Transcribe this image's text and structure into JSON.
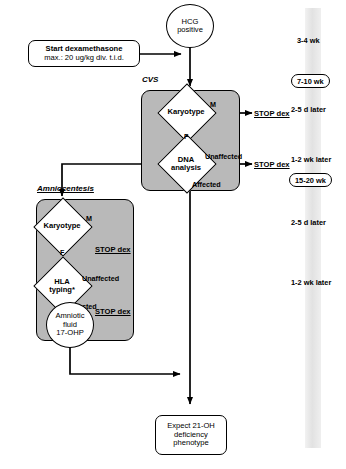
{
  "start": {
    "hcg_label": "HCG\npositive",
    "hcg_line1": "HCG",
    "hcg_line2": "positive",
    "treatment_line1": "Start dexamethasone",
    "treatment_line2": "max.: 20 ug/kg div. t.i.d."
  },
  "cvs": {
    "section_label": "CVS",
    "karyotype": "Karyotype",
    "dna_line1": "DNA",
    "dna_line2": "analysis",
    "branch_male": "M",
    "branch_female": "F",
    "branch_unaffected": "Unaffected",
    "branch_affected": "Affected",
    "stop_dex_male": "STOP dex",
    "stop_dex_unaffected": "STOP dex"
  },
  "amniocentesis": {
    "section_label": "Amniocentesis",
    "karyotype": "Karyotype",
    "hla_line1": "HLA",
    "hla_line2": "typing*",
    "branch_male": "M",
    "branch_female": "F",
    "branch_unaffected": "Unaffected",
    "branch_affected": "Affected",
    "stop_dex_male": "STOP dex",
    "stop_dex_unaffected": "STOP dex",
    "fluid_line1": "Amniotic",
    "fluid_line2": "fluid",
    "fluid_line3": "17-OHP"
  },
  "outcome": {
    "line1": "Expect 21-OH",
    "line2": "deficiency",
    "line3": "phenotype"
  },
  "timeline": {
    "items": [
      {
        "text": "3-4 wk",
        "boxed": false
      },
      {
        "text": "7-10 wk",
        "boxed": true
      },
      {
        "text": "2-5 d later",
        "boxed": false
      },
      {
        "text": "1-2 wk later",
        "boxed": false
      },
      {
        "text": "15-20 wk",
        "boxed": true
      },
      {
        "text": "2-5 d later",
        "boxed": false
      },
      {
        "text": "1-2 wk later",
        "boxed": false
      }
    ]
  },
  "colors": {
    "panel_fill": "#b9b9b9",
    "stroke": "#000000",
    "node_fill": "#ffffff",
    "timeband": "#e6e6e6"
  }
}
